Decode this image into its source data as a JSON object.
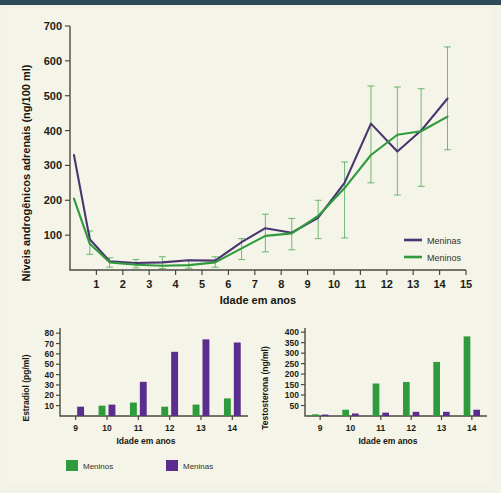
{
  "figure": {
    "background_color": "#f4f4e8",
    "accent_bar_color": "#2d4a5c",
    "colors": {
      "girls_purple": "#4a3570",
      "boys_green": "#2f9b3c",
      "axis": "#4a4a40",
      "text": "#16160f"
    }
  },
  "chart_data": [
    {
      "id": "main",
      "type": "line",
      "title": "",
      "xlabel": "Idade em anos",
      "ylabel": "Níveis androgênicos adrenais (ng/100 ml)",
      "xlim": [
        0,
        15
      ],
      "ylim": [
        0,
        700
      ],
      "xticks": [
        1,
        2,
        3,
        4,
        5,
        6,
        7,
        8,
        9,
        10,
        11,
        12,
        13,
        14,
        15
      ],
      "yticks": [
        100,
        200,
        300,
        400,
        500,
        600,
        700
      ],
      "grid": false,
      "legend_position": "right-inside",
      "x": [
        0.15,
        0.75,
        1.5,
        2.5,
        3.5,
        4.5,
        5.5,
        6.5,
        7.4,
        8.4,
        9.4,
        10.4,
        11.4,
        12.4,
        13.3,
        14.3
      ],
      "series": [
        {
          "name": "Meninas",
          "color": "#4a3570",
          "values": [
            330,
            88,
            25,
            20,
            20,
            28,
            27,
            28,
            80,
            120,
            107,
            150,
            250,
            420,
            340,
            400,
            492
          ],
          "points": [
            330,
            88,
            25,
            20,
            22,
            28,
            27,
            80,
            120,
            107,
            150,
            250,
            420,
            340,
            400,
            492
          ]
        },
        {
          "name": "Meninos",
          "color": "#2f9b3c",
          "points": [
            205,
            75,
            22,
            15,
            12,
            14,
            22,
            62,
            98,
            105,
            155,
            235,
            330,
            388,
            398,
            440
          ],
          "errors_low": [
            null,
            45,
            8,
            6,
            4,
            5,
            8,
            30,
            52,
            58,
            90,
            92,
            250,
            215,
            240,
            345
          ],
          "errors_high": [
            null,
            112,
            35,
            30,
            38,
            28,
            38,
            90,
            160,
            148,
            200,
            310,
            528,
            525,
            520,
            640
          ]
        }
      ],
      "legend": [
        {
          "label": "Meninas",
          "color": "#4a3570"
        },
        {
          "label": "Meninos",
          "color": "#2f9b3c"
        }
      ]
    },
    {
      "id": "estradiol",
      "type": "bar",
      "title": "",
      "xlabel": "Idade em anos",
      "ylabel": "Estradiol (pg/ml)",
      "categories": [
        "9",
        "10",
        "11",
        "12",
        "13",
        "14"
      ],
      "ylim": [
        0,
        85
      ],
      "yticks": [
        10,
        20,
        30,
        40,
        50,
        60,
        70,
        80
      ],
      "grid": false,
      "series": [
        {
          "name": "Meninos",
          "color": "#2f9b3c",
          "values": [
            0,
            10,
            13,
            9,
            11,
            17
          ]
        },
        {
          "name": "Meninas",
          "color": "#5b2d8e",
          "values": [
            9,
            11,
            33,
            62,
            74,
            71
          ]
        }
      ]
    },
    {
      "id": "testosterona",
      "type": "bar",
      "title": "",
      "xlabel": "Idade em anos",
      "ylabel": "Testosterona (ng/ml)",
      "categories": [
        "9",
        "10",
        "11",
        "12",
        "13",
        "14"
      ],
      "ylim": [
        0,
        420
      ],
      "yticks": [
        50,
        100,
        150,
        200,
        250,
        300,
        350,
        400
      ],
      "grid": false,
      "series": [
        {
          "name": "Meninos",
          "color": "#2f9b3c",
          "values": [
            8,
            30,
            155,
            162,
            258,
            380
          ]
        },
        {
          "name": "Meninas",
          "color": "#5b2d8e",
          "values": [
            7,
            12,
            16,
            20,
            20,
            30
          ]
        }
      ]
    }
  ],
  "shared_legend": [
    {
      "label": "Meninos",
      "color": "#2f9b3c"
    },
    {
      "label": "Meninas",
      "color": "#5b2d8e"
    }
  ]
}
